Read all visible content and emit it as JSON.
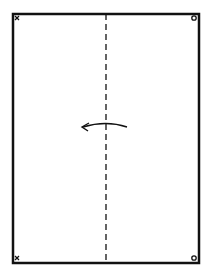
{
  "diagram": {
    "type": "paper-folding-step",
    "paper": {
      "shape": "rectangle",
      "stroke": "#111111",
      "fill": "#ffffff"
    },
    "fold_line": {
      "style": "dashed",
      "orientation": "vertical",
      "position": "center"
    },
    "arrow": {
      "direction": "left",
      "meaning": "fold right half over to the left"
    },
    "corner_marks": {
      "top_left": "x",
      "bottom_left": "x",
      "top_right": "o",
      "bottom_right": "o"
    },
    "colors": {
      "ink": "#111111",
      "background": "#ffffff"
    }
  }
}
